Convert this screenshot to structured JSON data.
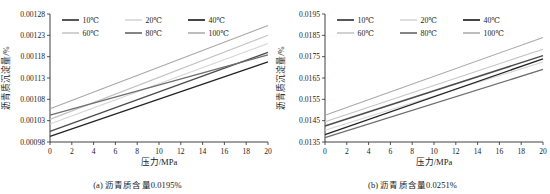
{
  "figure": {
    "panels": [
      {
        "id": "panel-a",
        "caption": "(a) 沥青质含量0.0195%",
        "chart_data": {
          "type": "line",
          "title": "",
          "xlabel": "压力/MPa",
          "ylabel": "沥青质沉淀量/%",
          "xlim": [
            0,
            20
          ],
          "ylim": [
            0.00098,
            0.00128
          ],
          "xticks": [
            0,
            2,
            4,
            6,
            8,
            10,
            12,
            14,
            16,
            18,
            20
          ],
          "xticklabels": [
            "0",
            "2",
            "4",
            "6",
            "8",
            "10",
            "12",
            "14",
            "16",
            "18",
            "20"
          ],
          "yticks": [
            0.00098,
            0.00103,
            0.00108,
            0.00113,
            0.00118,
            0.00123,
            0.00128
          ],
          "yticklabels": [
            "0.00098",
            "0.00103",
            "0.00108",
            "0.00113",
            "0.00118",
            "0.00123",
            "0.00128"
          ],
          "grid": false,
          "legend_position": "upper left",
          "x": [
            0,
            20
          ],
          "series": [
            {
              "name": "10℃",
              "color": "#4d4d4d",
              "width": 1.5,
              "values": [
                0.001005,
                0.00119
              ]
            },
            {
              "name": "20℃",
              "color": "#d5d5d5",
              "width": 1.1,
              "values": [
                0.001022,
                0.001211
              ]
            },
            {
              "name": "40℃",
              "color": "#232323",
              "width": 1.3,
              "values": [
                0.000993,
                0.001168
              ]
            },
            {
              "name": "60℃",
              "color": "#c2c2c2",
              "width": 1.1,
              "values": [
                0.001033,
                0.00123
              ]
            },
            {
              "name": "80℃",
              "color": "#6e6e6e",
              "width": 1.3,
              "values": [
                0.001043,
                0.001184
              ]
            },
            {
              "name": "100℃",
              "color": "#a8a8a8",
              "width": 1.1,
              "values": [
                0.001058,
                0.001253
              ]
            }
          ]
        }
      },
      {
        "id": "panel-b",
        "caption": "(b) 沥青质含量0.0251%",
        "chart_data": {
          "type": "line",
          "title": "",
          "xlabel": "压力/MPa",
          "ylabel": "沥青质沉淀量/%",
          "xlim": [
            0,
            20
          ],
          "ylim": [
            0.0135,
            0.0195
          ],
          "xticks": [
            0,
            2,
            4,
            6,
            8,
            10,
            12,
            14,
            16,
            18,
            20
          ],
          "xticklabels": [
            "0",
            "2",
            "4",
            "6",
            "8",
            "10",
            "12",
            "14",
            "16",
            "18",
            "20"
          ],
          "yticks": [
            0.0135,
            0.0145,
            0.0155,
            0.0165,
            0.0175,
            0.0185,
            0.0195
          ],
          "yticklabels": [
            "0.0135",
            "0.0145",
            "0.0155",
            "0.0165",
            "0.0175",
            "0.0185",
            "0.0195"
          ],
          "grid": false,
          "legend_position": "upper left",
          "x": [
            0,
            20
          ],
          "series": [
            {
              "name": "10℃",
              "color": "#4d4d4d",
              "width": 1.5,
              "values": [
                0.01425,
                0.01755
              ]
            },
            {
              "name": "20℃",
              "color": "#d5d5d5",
              "width": 1.1,
              "values": [
                0.01405,
                0.01725
              ]
            },
            {
              "name": "40℃",
              "color": "#232323",
              "width": 1.3,
              "values": [
                0.01385,
                0.0174
              ]
            },
            {
              "name": "60℃",
              "color": "#c2c2c2",
              "width": 1.1,
              "values": [
                0.01445,
                0.01785
              ]
            },
            {
              "name": "80℃",
              "color": "#6e6e6e",
              "width": 1.3,
              "values": [
                0.0137,
                0.0169
              ]
            },
            {
              "name": "100℃",
              "color": "#a8a8a8",
              "width": 1.1,
              "values": [
                0.01475,
                0.0184
              ]
            }
          ]
        }
      }
    ]
  }
}
